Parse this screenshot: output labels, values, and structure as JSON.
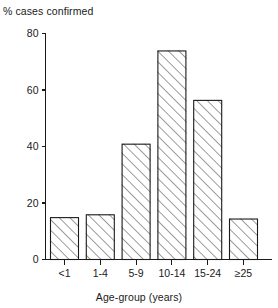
{
  "chart_data": {
    "type": "bar",
    "title": "",
    "ylabel": "% cases confirmed",
    "xlabel": "Age-group (years)",
    "categories": [
      "<1",
      "1-4",
      "5-9",
      "10-14",
      "15-24",
      "≥25"
    ],
    "values": [
      15,
      16,
      41,
      74,
      56.5,
      14.5
    ],
    "ylim": [
      0,
      80
    ],
    "yticks": [
      0,
      20,
      40,
      60,
      80
    ],
    "ytick_labels": [
      "0",
      "20",
      "40",
      "60",
      "80"
    ],
    "grid": false,
    "legend": null,
    "bar_style": {
      "fill": "hatch-diagonal",
      "edge_color": "#1a1a1a",
      "hatch_color": "#4d4d4d",
      "face_color": "#ffffff"
    }
  },
  "axes": {
    "y_axis_caption": "% cases confirmed",
    "x_axis_caption": "Age-group (years)"
  },
  "colors": {
    "background": "#ffffff",
    "ink": "#1a1a1a",
    "hatch": "#4d4d4d"
  }
}
